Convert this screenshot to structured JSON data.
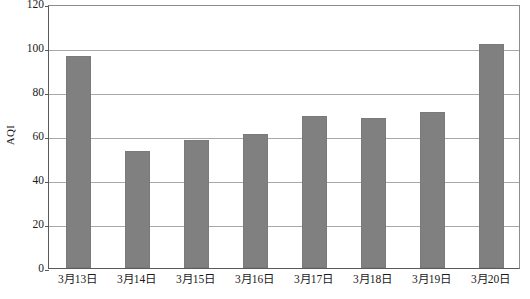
{
  "chart_data": {
    "type": "bar",
    "title": "",
    "xlabel": "",
    "ylabel": "AQI",
    "categories": [
      "3月13日",
      "3月14日",
      "3月15日",
      "3月16日",
      "3月17日",
      "3月18日",
      "3月19日",
      "3月20日"
    ],
    "values": [
      96.5,
      53,
      58,
      61,
      69,
      68,
      71,
      102
    ],
    "ylim": [
      0,
      120
    ],
    "ytick_labels": [
      "0",
      "20",
      "40",
      "60",
      "80",
      "100",
      "120"
    ],
    "ytick_values": [
      0,
      20,
      40,
      60,
      80,
      100,
      120
    ],
    "grid": true,
    "legend": false,
    "bar_color": "#808080",
    "grid_color": "#a8a8a8",
    "axis_color": "#5a5a5a",
    "background": "#ffffff"
  }
}
